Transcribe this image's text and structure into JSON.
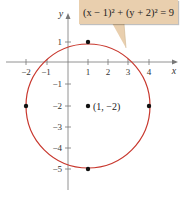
{
  "diagram": {
    "equation_callout": "(x − 1)² + (y + 2)² = 9",
    "center_label": "(1, −2)",
    "axes": {
      "x_label": "x",
      "y_label": "y",
      "x_ticks": [
        "−2",
        "−1",
        "1",
        "2",
        "3",
        "4"
      ],
      "y_ticks": [
        "1",
        "−1",
        "−2",
        "−3",
        "−4",
        "−5"
      ]
    },
    "circle": {
      "center": [
        1,
        -2
      ],
      "radius": 3,
      "color": "#c8372d"
    },
    "marked_points": [
      [
        1,
        1
      ],
      [
        -2,
        -2
      ],
      [
        4,
        -2
      ],
      [
        1,
        -5
      ],
      [
        1,
        -2
      ]
    ],
    "callout_color": "#e9cfae"
  }
}
